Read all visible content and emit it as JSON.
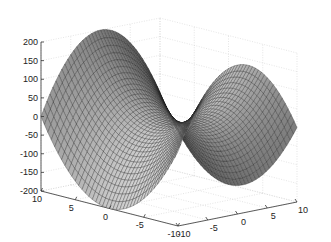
{
  "chart_data": {
    "type": "surface",
    "function": "z = 2*(u^2 - v^2)",
    "title": "",
    "xlabel": "",
    "ylabel": "",
    "zlabel": "",
    "grid": true,
    "colormap": "gray",
    "u_range": [
      -10,
      10
    ],
    "v_range": [
      -10,
      10
    ],
    "z_range": [
      -200,
      200
    ],
    "mesh_steps": 40,
    "z_ticks": [
      "200",
      "150",
      "100",
      "50",
      "0",
      "-50",
      "-100",
      "-150",
      "-200"
    ],
    "z_tick_values": [
      200,
      150,
      100,
      50,
      0,
      -50,
      -100,
      -150,
      -200
    ],
    "left_axis_ticks": [
      "10",
      "5",
      "0",
      "-5",
      "-10"
    ],
    "left_axis_values": [
      10,
      5,
      0,
      -5,
      -10
    ],
    "right_axis_ticks": [
      "-10",
      "-5",
      "0",
      "5",
      "10"
    ],
    "right_axis_values": [
      -10,
      -5,
      0,
      5,
      10
    ]
  }
}
